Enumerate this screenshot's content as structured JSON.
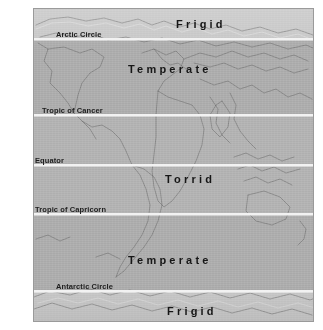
{
  "colors": {
    "frigid_band": "#c8c8c8",
    "temperate_band": "#acacac",
    "torrid_band": "#b2b2b2",
    "latitude_line": "#f2f2f2",
    "frame_border": "#9a9a9a",
    "label_text": "#161616",
    "coastline": "#5a5a5a"
  },
  "zones": [
    {
      "name": "frigid-north",
      "label": "Frigid",
      "top": 0,
      "height": 30,
      "left_pct": 60.5
    },
    {
      "name": "temperate-north",
      "label": "Temperate",
      "top": 30,
      "height": 76,
      "left_pct": 36.0
    },
    {
      "name": "torrid",
      "label": "Torrid",
      "top": 106,
      "height": 98,
      "left_pct": 44.0
    },
    {
      "name": "temperate-south",
      "label": "Temperate",
      "top": 204,
      "height": 77,
      "left_pct": 36.0
    },
    {
      "name": "frigid-south",
      "label": "Frigid",
      "top": 281,
      "height": 33,
      "left_pct": 44.5
    }
  ],
  "zone_captions": [
    {
      "name": "zone-caption-frigid-north",
      "text": "Frigid",
      "x": 142,
      "y": 9
    },
    {
      "name": "zone-caption-temperate-north",
      "text": "Temperate",
      "x": 94,
      "y": 54
    },
    {
      "name": "zone-caption-torrid",
      "text": "Torrid",
      "x": 131,
      "y": 164
    },
    {
      "name": "zone-caption-temperate-south",
      "text": "Temperate",
      "x": 94,
      "y": 245
    },
    {
      "name": "zone-caption-frigid-south",
      "text": "Frigid",
      "x": 133,
      "y": 296
    }
  ],
  "latitudes": [
    {
      "name": "arctic-circle",
      "label": "Arctic Circle",
      "y": 29,
      "label_x": 22,
      "label_y": 21
    },
    {
      "name": "tropic-of-cancer",
      "label": "Tropic of Cancer",
      "y": 105,
      "label_x": 8,
      "label_y": 97
    },
    {
      "name": "equator",
      "label": "Equator",
      "y": 155,
      "label_x": 1,
      "label_y": 147
    },
    {
      "name": "tropic-of-capricorn",
      "label": "Tropic of Capricorn",
      "y": 204,
      "label_x": 1,
      "label_y": 196
    },
    {
      "name": "antarctic-circle",
      "label": "Antarctic Circle",
      "y": 281,
      "label_x": 22,
      "label_y": 273
    }
  ]
}
